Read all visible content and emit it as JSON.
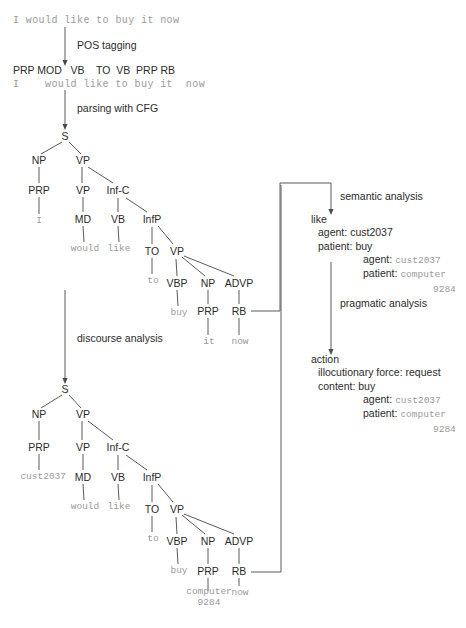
{
  "diagram": {
    "background": "#ffffff",
    "ink": "#2b2b2b",
    "terminal_color": "#9a9a9a"
  },
  "source": {
    "sentence": "I would like to buy it now"
  },
  "steps": {
    "pos_tagging": "POS tagging",
    "parsing": "parsing with CFG",
    "discourse": "discourse analysis",
    "semantic": "semantic analysis",
    "pragmatic": "pragmatic analysis"
  },
  "pos_row": {
    "tags": "PRP MOD   VB    TO  VB  PRP RB",
    "words": "I    would like to buy it  now"
  },
  "tree1": {
    "nodes": [
      {
        "id": "s",
        "label": "S",
        "x": 65,
        "y": 136
      },
      {
        "id": "np",
        "label": "NP",
        "x": 39,
        "y": 160
      },
      {
        "id": "vp",
        "label": "VP",
        "x": 83,
        "y": 160
      },
      {
        "id": "prp",
        "label": "PRP",
        "x": 39,
        "y": 190
      },
      {
        "id": "vp2",
        "label": "VP",
        "x": 83,
        "y": 190
      },
      {
        "id": "infc",
        "label": "Inf-C",
        "x": 118,
        "y": 190
      },
      {
        "id": "md",
        "label": "MD",
        "x": 83,
        "y": 219
      },
      {
        "id": "vb",
        "label": "VB",
        "x": 118,
        "y": 219
      },
      {
        "id": "infp",
        "label": "InfP",
        "x": 152,
        "y": 219
      },
      {
        "id": "to",
        "label": "TO",
        "x": 152,
        "y": 251
      },
      {
        "id": "vp3",
        "label": "VP",
        "x": 177,
        "y": 251
      },
      {
        "id": "vbp",
        "label": "VBP",
        "x": 177,
        "y": 283
      },
      {
        "id": "np2",
        "label": "NP",
        "x": 208,
        "y": 283
      },
      {
        "id": "advp",
        "label": "ADVP",
        "x": 239,
        "y": 283
      },
      {
        "id": "prp2",
        "label": "PRP",
        "x": 208,
        "y": 311
      },
      {
        "id": "rb",
        "label": "RB",
        "x": 239,
        "y": 311
      }
    ],
    "edges": [
      [
        "s",
        "np"
      ],
      [
        "s",
        "vp"
      ],
      [
        "np",
        "prp"
      ],
      [
        "vp",
        "vp2"
      ],
      [
        "vp",
        "infc"
      ],
      [
        "prp",
        "i"
      ],
      [
        "vp2",
        "md"
      ],
      [
        "infc",
        "vb"
      ],
      [
        "infc",
        "infp"
      ],
      [
        "md",
        "would"
      ],
      [
        "vb",
        "like"
      ],
      [
        "infp",
        "to"
      ],
      [
        "infp",
        "vp3"
      ],
      [
        "to",
        "toW"
      ],
      [
        "vp3",
        "vbp"
      ],
      [
        "vp3",
        "np2"
      ],
      [
        "vp3",
        "advp"
      ],
      [
        "vbp",
        "buy"
      ],
      [
        "np2",
        "prp2"
      ],
      [
        "advp",
        "rb"
      ],
      [
        "prp2",
        "it"
      ],
      [
        "rb",
        "now"
      ]
    ],
    "terminals": [
      {
        "id": "i",
        "text": "I",
        "x": 39,
        "y": 221
      },
      {
        "id": "would",
        "text": "would",
        "x": 85,
        "y": 249
      },
      {
        "id": "like",
        "text": "like",
        "x": 119,
        "y": 249
      },
      {
        "id": "toW",
        "text": "to",
        "x": 153,
        "y": 281
      },
      {
        "id": "buy",
        "text": "buy",
        "x": 179,
        "y": 313
      },
      {
        "id": "it",
        "text": "it",
        "x": 209,
        "y": 342
      },
      {
        "id": "now",
        "text": "now",
        "x": 240,
        "y": 342
      }
    ]
  },
  "tree2": {
    "nodes": [
      {
        "id": "s",
        "label": "S",
        "x": 65,
        "y": 389
      },
      {
        "id": "np",
        "label": "NP",
        "x": 39,
        "y": 414
      },
      {
        "id": "vp",
        "label": "VP",
        "x": 83,
        "y": 414
      },
      {
        "id": "prp",
        "label": "PRP",
        "x": 39,
        "y": 447
      },
      {
        "id": "vp2",
        "label": "VP",
        "x": 83,
        "y": 447
      },
      {
        "id": "infc",
        "label": "Inf-C",
        "x": 118,
        "y": 447
      },
      {
        "id": "md",
        "label": "MD",
        "x": 83,
        "y": 477
      },
      {
        "id": "vb",
        "label": "VB",
        "x": 118,
        "y": 477
      },
      {
        "id": "infp",
        "label": "InfP",
        "x": 152,
        "y": 477
      },
      {
        "id": "to",
        "label": "TO",
        "x": 152,
        "y": 509
      },
      {
        "id": "vp3",
        "label": "VP",
        "x": 177,
        "y": 509
      },
      {
        "id": "vbp",
        "label": "VBP",
        "x": 177,
        "y": 541
      },
      {
        "id": "np2",
        "label": "NP",
        "x": 208,
        "y": 541
      },
      {
        "id": "advp",
        "label": "ADVP",
        "x": 239,
        "y": 541
      },
      {
        "id": "prp2",
        "label": "PRP",
        "x": 208,
        "y": 571
      },
      {
        "id": "rb",
        "label": "RB",
        "x": 239,
        "y": 571
      }
    ],
    "edges": [
      [
        "s",
        "np"
      ],
      [
        "s",
        "vp"
      ],
      [
        "np",
        "prp"
      ],
      [
        "vp",
        "vp2"
      ],
      [
        "vp",
        "infc"
      ],
      [
        "prp",
        "cust"
      ],
      [
        "vp2",
        "md"
      ],
      [
        "infc",
        "vb"
      ],
      [
        "infc",
        "infp"
      ],
      [
        "md",
        "would"
      ],
      [
        "vb",
        "like"
      ],
      [
        "infp",
        "to"
      ],
      [
        "infp",
        "vp3"
      ],
      [
        "to",
        "toW"
      ],
      [
        "vp3",
        "vbp"
      ],
      [
        "vp3",
        "np2"
      ],
      [
        "vp3",
        "advp"
      ],
      [
        "vbp",
        "buy"
      ],
      [
        "np2",
        "prp2"
      ],
      [
        "advp",
        "rb"
      ],
      [
        "prp2",
        "comp"
      ],
      [
        "rb",
        "now"
      ]
    ],
    "terminals": [
      {
        "id": "cust",
        "text": "cust2037",
        "x": 66,
        "y": 477,
        "align": "right"
      },
      {
        "id": "would",
        "text": "would",
        "x": 85,
        "y": 507
      },
      {
        "id": "like",
        "text": "like",
        "x": 119,
        "y": 507
      },
      {
        "id": "toW",
        "text": "to",
        "x": 153,
        "y": 539
      },
      {
        "id": "buy",
        "text": "buy",
        "x": 179,
        "y": 571
      },
      {
        "id": "comp",
        "text": "computer\n9284",
        "x": 209,
        "y": 598
      },
      {
        "id": "now",
        "text": "now",
        "x": 240,
        "y": 593
      }
    ]
  },
  "semantic_frame": {
    "head": "like",
    "lines": [
      {
        "label": "agent: ",
        "value": "cust2037",
        "value_style": "plain",
        "indent": "1"
      },
      {
        "label": "patient: ",
        "value": "buy",
        "value_style": "plain",
        "indent": "1"
      },
      {
        "label": "agent: ",
        "value": "cust2037",
        "value_style": "mono",
        "indent": "deep"
      },
      {
        "label": "patient: ",
        "value": "computer",
        "value_style": "mono",
        "indent": "deep"
      },
      {
        "label": "",
        "value": "9284",
        "value_style": "mono",
        "indent": "cont"
      }
    ]
  },
  "pragmatic_frame": {
    "head": "action",
    "lines": [
      {
        "label": "illocutionary force: request",
        "value": "",
        "value_style": "plain",
        "indent": "1"
      },
      {
        "label": "content: buy",
        "value": "",
        "value_style": "plain",
        "indent": "1"
      },
      {
        "label": "agent: ",
        "value": "cust2037",
        "value_style": "mono",
        "indent": "deep"
      },
      {
        "label": "patient: ",
        "value": "computer",
        "value_style": "mono",
        "indent": "deep"
      },
      {
        "label": "",
        "value": "9284",
        "value_style": "mono",
        "indent": "cont"
      }
    ]
  }
}
